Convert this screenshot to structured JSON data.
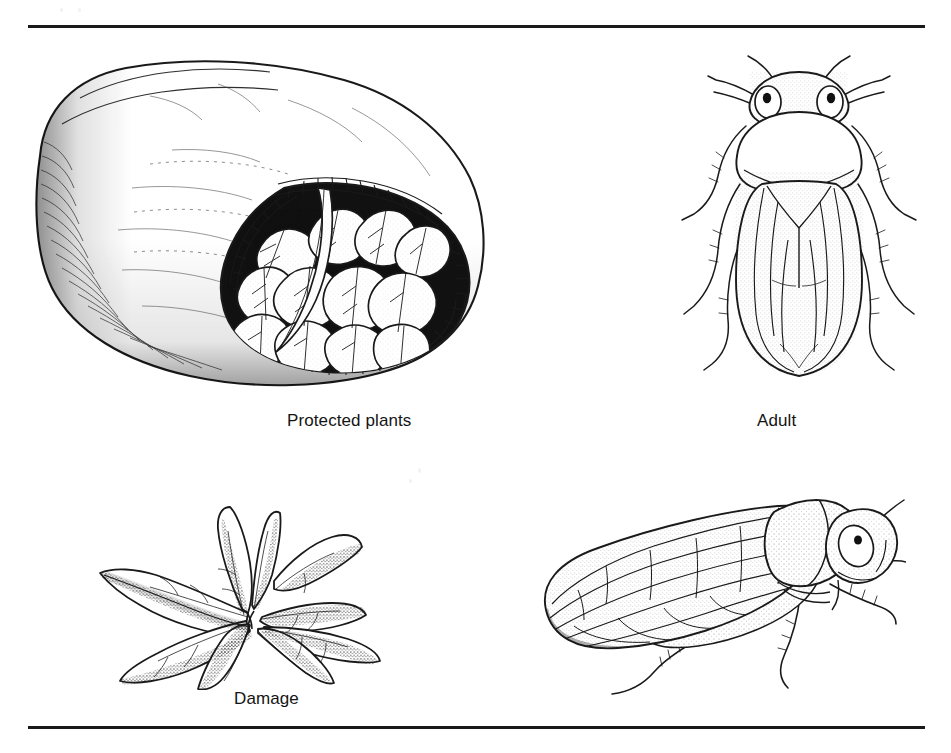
{
  "page": {
    "background_color": "#ffffff",
    "ink_color": "#1a1a1a",
    "rule_color": "#1a1a1a",
    "figure_count": 4
  },
  "rules": {
    "top_label": "top-horizontal-rule",
    "bottom_label": "bottom-horizontal-rule"
  },
  "figures": [
    {
      "id": "protected-plants",
      "caption": "Protected plants",
      "subject": "floating row cover tunnel over leafy lettuce plants",
      "technique": "pen-and-ink stipple line drawing",
      "view": "three-quarter perspective, open end facing right"
    },
    {
      "id": "adult",
      "caption": "Adult",
      "subject": "adult leafhopper",
      "technique": "pen-and-ink stipple line drawing",
      "view": "dorsal"
    },
    {
      "id": "damage",
      "caption": "Damage",
      "subject": "lettuce plant with necrotic, browned leaf margins and curled leaves",
      "technique": "pen-and-ink stipple line drawing",
      "view": "three-quarter perspective"
    },
    {
      "id": "adult-lateral",
      "caption": "",
      "subject": "adult leafhopper",
      "technique": "pen-and-ink stipple line drawing",
      "view": "lateral, facing right"
    }
  ],
  "captions": {
    "protected_plants": "Protected plants",
    "adult": "Adult",
    "damage": "Damage"
  }
}
